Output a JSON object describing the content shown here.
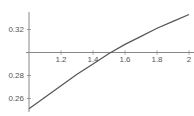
{
  "chart_data": {
    "type": "line",
    "title": "",
    "xlabel": "",
    "ylabel": "",
    "xlim": [
      1.0,
      2.0
    ],
    "ylim": [
      0.25,
      0.335
    ],
    "axes_origin": {
      "x": 1.0,
      "y": 0.3
    },
    "grid": false,
    "legend": null,
    "x_ticks": [
      "1.2",
      "1.4",
      "1.6",
      "1.8",
      "2"
    ],
    "y_ticks": [
      "0.26",
      "0.28",
      "0.32"
    ],
    "series": [
      {
        "name": "curve",
        "x": [
          1.0,
          1.1,
          1.2,
          1.3,
          1.4,
          1.5,
          1.6,
          1.7,
          1.8,
          1.9,
          2.0
        ],
        "values": [
          0.251,
          0.261,
          0.271,
          0.281,
          0.29,
          0.299,
          0.307,
          0.314,
          0.321,
          0.327,
          0.333
        ]
      }
    ]
  },
  "colors": {
    "axis": "#888888",
    "line": "#555555",
    "text": "#555555"
  }
}
